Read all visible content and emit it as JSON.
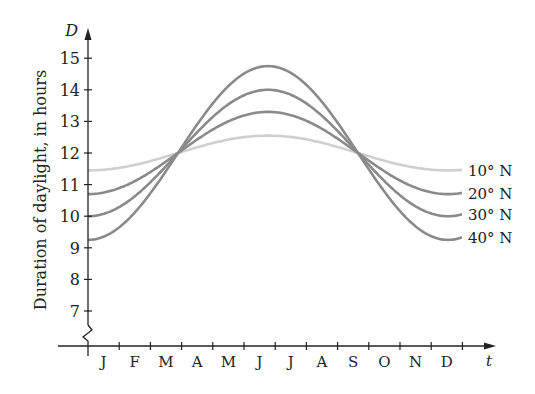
{
  "chart_data": {
    "type": "line",
    "title": "",
    "xlabel": "t",
    "ylabel": "Duration of daylight, in hours",
    "y_axis_symbol": "D",
    "ylim": [
      7,
      15
    ],
    "yticks": [
      7,
      8,
      9,
      10,
      11,
      12,
      13,
      14,
      15
    ],
    "categories": [
      "J",
      "F",
      "M",
      "A",
      "M",
      "J",
      "J",
      "A",
      "S",
      "O",
      "N",
      "D"
    ],
    "series": [
      {
        "name": "10° N",
        "color": "#cfcfcf",
        "mean": 12.0,
        "amplitude": 0.55,
        "start": 11.45,
        "max": 12.55
      },
      {
        "name": "20° N",
        "color": "#8a8a8a",
        "mean": 12.0,
        "amplitude": 1.3,
        "start": 10.75,
        "max": 13.3
      },
      {
        "name": "30° N",
        "color": "#8a8a8a",
        "mean": 12.0,
        "amplitude": 2.0,
        "start": 10.05,
        "max": 14.05
      },
      {
        "name": "40° N",
        "color": "#8a8a8a",
        "mean": 12.0,
        "amplitude": 2.75,
        "start": 9.3,
        "max": 14.8
      }
    ],
    "annotations": [
      "axis break between 0 and 7 on D-axis"
    ],
    "grid": false,
    "legend": "inline labels at right end of curves"
  }
}
